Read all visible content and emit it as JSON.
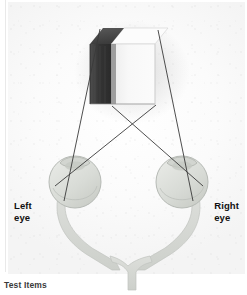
{
  "figure": {
    "caption": "Test Items",
    "labels": {
      "left_eye_line1": "Left",
      "left_eye_line2": "eye",
      "right_eye_line1": "Right",
      "right_eye_line2": "eye"
    },
    "colors": {
      "background": "#ffffff",
      "paper": "#fbfbfb",
      "sight_line": "#3a3a3a",
      "block_dark_face": "#3d3d3d",
      "block_top_dark": "#4a4a4a",
      "block_light_face": "#f7f7f7",
      "block_top_light": "#fcfcfc",
      "eye_fill": "#dcdedb",
      "eye_stroke": "#b9bdb8",
      "nerve_fill": "#d6d8d4",
      "label_text": "#111111",
      "caption_text": "#3a3a3a"
    },
    "block": {
      "name": "striped-rectangular-block",
      "dark_half_label": "dark face",
      "light_half_label": "light face"
    },
    "eyes": [
      {
        "id": "left-eye",
        "cx": 75,
        "cy": 180
      },
      {
        "id": "right-eye",
        "cx": 182,
        "cy": 180
      }
    ],
    "sight_lines": [
      {
        "id": "left-eye-to-block-left",
        "from": "left-eye",
        "to": "block-top-left"
      },
      {
        "id": "left-eye-to-block-right",
        "from": "left-eye",
        "to": "block-bottom-right"
      },
      {
        "id": "right-eye-to-block-right",
        "from": "right-eye",
        "to": "block-top-right"
      },
      {
        "id": "right-eye-to-block-left",
        "from": "right-eye",
        "to": "block-bottom-left"
      }
    ],
    "crossing_point": {
      "x": 133,
      "y": 125
    }
  }
}
